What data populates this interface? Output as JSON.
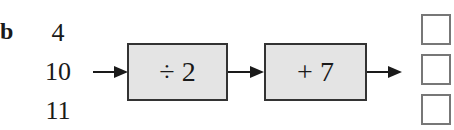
{
  "exercise": {
    "part_label": "b",
    "inputs": [
      "4",
      "10",
      "11"
    ],
    "operations": [
      {
        "label": "÷ 2"
      },
      {
        "label": "+ 7"
      }
    ],
    "answer_boxes": [
      "",
      "",
      ""
    ]
  }
}
